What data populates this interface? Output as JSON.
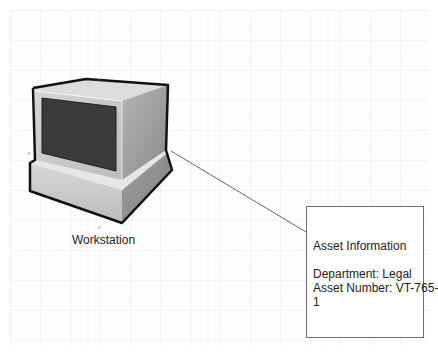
{
  "diagram": {
    "shape": {
      "type": "workstation-monitor",
      "label": "Workstation"
    },
    "callout": {
      "title": "Asset Information",
      "lines": [
        "Department: Legal",
        "Asset Number: VT-765-",
        "1"
      ]
    },
    "connector": {
      "from": "workstation",
      "to": "callout"
    },
    "grid": {
      "visible": true
    }
  },
  "colors": {
    "grid_minor": "#eeeeee",
    "grid_major": "#dcdcdc",
    "outline": "#111111",
    "bezel": "#c9c9c9",
    "top": "#dedede",
    "side": "#9a9a9a",
    "screen": "#3b3b3b",
    "connector": "#666666"
  }
}
